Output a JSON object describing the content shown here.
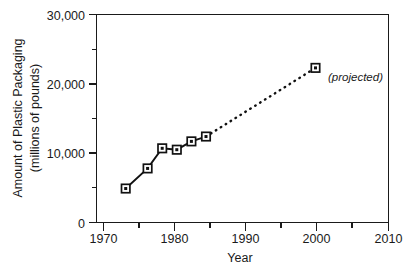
{
  "chart_data": {
    "type": "line",
    "title": "",
    "xlabel": "Year",
    "ylabel": "Amount of Plastic Packaging (millions of pounds)",
    "ylabel_line1": "Amount of Plastic Packaging",
    "ylabel_line2": "(millions of pounds)",
    "xlim": [
      1970,
      2010
    ],
    "ylim": [
      0,
      30000
    ],
    "grid": false,
    "legend": "none",
    "x_ticks": [
      1970,
      1980,
      1990,
      2000,
      2010
    ],
    "x_tick_labels": [
      "1970",
      "1980",
      "1990",
      "2000",
      "2010"
    ],
    "x_minor_ticks": [
      1975,
      1985,
      1995,
      2005
    ],
    "y_ticks": [
      0,
      10000,
      20000,
      30000
    ],
    "y_tick_labels": [
      "0",
      "10,000",
      "20,000",
      "30,000"
    ],
    "y_minor_ticks": [
      5000,
      15000,
      25000
    ],
    "series": [
      {
        "name": "Actual",
        "style": "solid",
        "marker": "square",
        "x": [
          1974,
          1977,
          1979,
          1981,
          1983,
          1985
        ],
        "values": [
          4900,
          7800,
          10700,
          10500,
          11700,
          12400
        ]
      },
      {
        "name": "Projected",
        "style": "dotted",
        "marker": "square",
        "x": [
          1985,
          2000
        ],
        "values": [
          12400,
          22300
        ]
      }
    ],
    "annotations": [
      {
        "text": "(projected)",
        "x": 2001,
        "y": 20600,
        "style": "italic"
      }
    ]
  },
  "axes": {
    "x_title": "Year",
    "y_title_line1": "Amount of Plastic Packaging",
    "y_title_line2": "(millions of pounds)"
  }
}
